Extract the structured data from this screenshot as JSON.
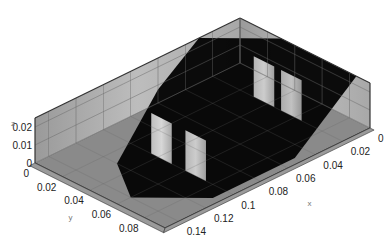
{
  "chart_data": {
    "type": "heatmap",
    "title": "",
    "subtitle": "",
    "projection": "3d-isometric-box",
    "colormap": "grayscale",
    "axes": {
      "x": {
        "label": "x",
        "range": [
          0,
          0.15
        ],
        "ticks": [
          0,
          0.02,
          0.04,
          0.06,
          0.08,
          0.1,
          0.12,
          0.14
        ],
        "tick_labels": [
          "0",
          "0.02",
          "0.04",
          "0.06",
          "0.08",
          "0.1",
          "0.12",
          "0.14"
        ]
      },
      "y": {
        "label": "y",
        "range": [
          0,
          0.095
        ],
        "ticks": [
          0,
          0.02,
          0.04,
          0.06,
          0.08
        ],
        "tick_labels": [
          "0",
          "0.02",
          "0.04",
          "0.06",
          "0.08"
        ]
      },
      "z": {
        "label": "z",
        "range": [
          0,
          0.025
        ],
        "ticks": [
          0,
          0.01,
          0.02
        ],
        "tick_labels": [
          "0",
          "0.01",
          "0.02"
        ]
      }
    },
    "grid": true,
    "legend": "none",
    "features": [
      {
        "name": "dark-core-region",
        "description": "large low-intensity (black) region spanning the center of the domain",
        "intensity": 0.05
      },
      {
        "name": "light-panel-1",
        "x": 0.1,
        "y_range": [
          0.035,
          0.05
        ],
        "intensity": 0.75
      },
      {
        "name": "light-panel-2",
        "x": 0.1,
        "y_range": [
          0.06,
          0.075
        ],
        "intensity": 0.7
      },
      {
        "name": "light-panel-3",
        "x": 0.02,
        "y_range": [
          0.03,
          0.045
        ],
        "intensity": 0.7
      },
      {
        "name": "light-panel-4",
        "x": 0.02,
        "y_range": [
          0.05,
          0.065
        ],
        "intensity": 0.65
      }
    ]
  }
}
